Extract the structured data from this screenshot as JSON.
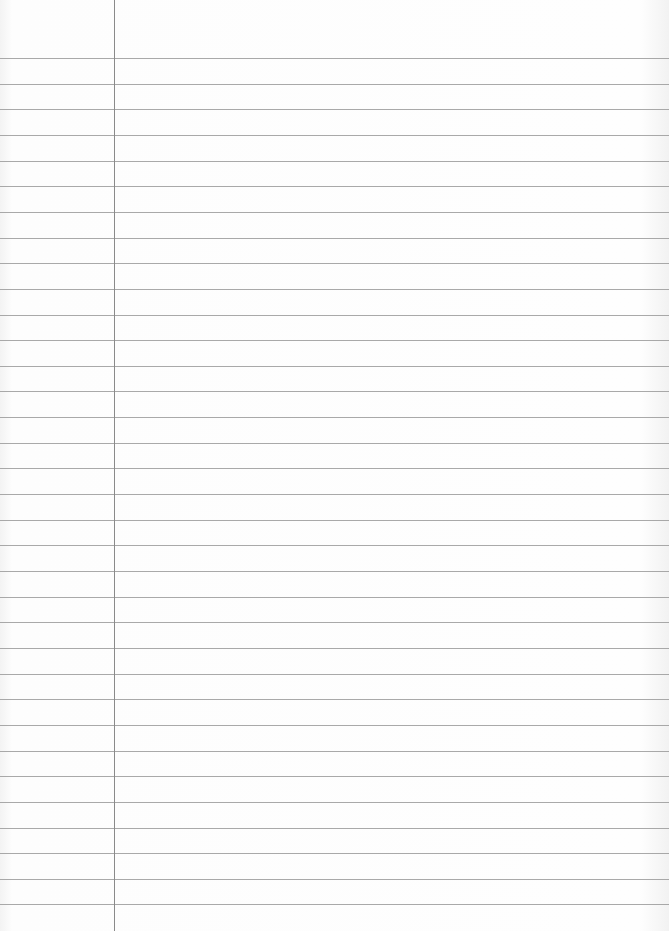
{
  "page": {
    "type": "lined-notebook-paper",
    "width": 669,
    "height": 931,
    "background_color": "#fbfbfb",
    "rule_color": "#9a9a9a",
    "margin_color": "#8a8a8a",
    "margin_x": 114,
    "first_rule_y": 58,
    "rule_spacing": 25.65,
    "rule_count": 34,
    "text_content": ""
  }
}
